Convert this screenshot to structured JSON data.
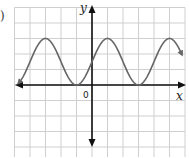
{
  "chart_data": {
    "type": "line",
    "title": "",
    "xlabel": "x",
    "ylabel": "y",
    "origin_label": "0",
    "grid": true,
    "grid_units": {
      "x_min": -5,
      "x_max": 6,
      "y_min": -5,
      "y_max": 5
    },
    "series": [
      {
        "name": "sinusoid",
        "description": "periodic curve with max at y=3, min at y=0, period 4 grid units",
        "x": [
          -4.8,
          -3,
          -1,
          1,
          3,
          5,
          6
        ],
        "y": [
          0.1,
          3,
          0,
          3,
          0,
          3,
          1.6
        ]
      }
    ],
    "max_value": 3,
    "min_value": 0,
    "y_intercept": 1.8,
    "period": 4,
    "colors": {
      "curve": "#666666",
      "axes": "#111111",
      "grid": "#c8c8c8"
    }
  },
  "labels": {
    "edge_mark": ")"
  }
}
